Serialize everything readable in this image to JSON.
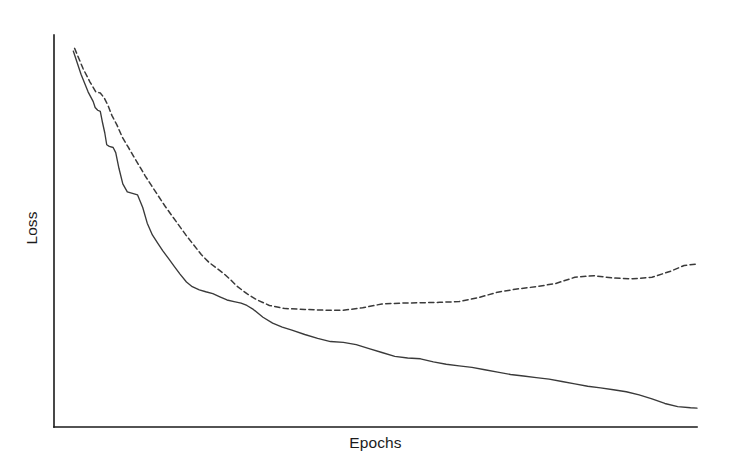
{
  "figure": {
    "width": 729,
    "height": 472,
    "background": "#ffffff",
    "title": ""
  },
  "axes": {
    "x_label": "Epochs",
    "y_label": "Loss",
    "line_color": "#1a1a1a",
    "origin_px": [
      54,
      427
    ],
    "x_end_px": [
      697,
      427
    ],
    "y_top_px": [
      54,
      35
    ]
  },
  "chart_data": {
    "type": "line",
    "title": "",
    "xlabel": "Epochs",
    "ylabel": "Loss",
    "grid": false,
    "legend": "none",
    "xlim": [
      0,
      100
    ],
    "ylim": [
      0,
      100
    ],
    "x_tick_labels": [],
    "y_tick_labels": [],
    "note": "Training loss (solid) decreases monotonically; validation loss (dashed) decreases then rises after its minimum, indicating overfitting. Axes are unlabelled (no numeric ticks). Values below are normalized: x = percent of epoch axis span, y = percent of loss axis height where 100 = top of axis.",
    "series": [
      {
        "name": "Training loss",
        "style": "solid",
        "color": "#3a3a3a",
        "dash": null,
        "x": [
          3.0,
          4.2,
          5.3,
          6.1,
          6.4,
          6.8,
          7.2,
          7.5,
          7.9,
          8.2,
          8.6,
          9.2,
          9.6,
          10.1,
          10.7,
          11.4,
          12.2,
          13.0,
          13.8,
          14.5,
          15.3,
          16.1,
          16.9,
          17.8,
          18.7,
          19.6,
          20.6,
          21.5,
          22.6,
          23.6,
          24.7,
          25.8,
          26.9,
          28.0,
          29.1,
          30.0,
          31.0,
          32.5,
          34.0,
          35.5,
          37.0,
          39.0,
          41.0,
          43.0,
          45.0,
          47.0,
          49.0,
          51.0,
          53.0,
          55.0,
          57.0,
          59.0,
          61.0,
          63.0,
          65.0,
          67.0,
          69.0,
          71.0,
          73.0,
          75.0,
          77.0,
          79.0,
          81.0,
          83.0,
          85.0,
          87.0,
          89.0,
          91.0,
          93.0,
          95.0,
          97.0,
          99.0,
          100.0
        ],
        "y": [
          95.9,
          90.0,
          85.5,
          83.0,
          81.5,
          80.8,
          80.5,
          78.0,
          75.0,
          72.0,
          71.6,
          71.3,
          70.0,
          66.0,
          62.0,
          60.0,
          59.6,
          59.2,
          56.0,
          52.0,
          49.0,
          47.0,
          45.0,
          43.0,
          41.0,
          39.0,
          37.0,
          35.8,
          35.0,
          34.5,
          34.0,
          33.2,
          32.4,
          32.0,
          31.6,
          31.0,
          30.0,
          28.0,
          26.5,
          25.5,
          24.7,
          23.6,
          22.6,
          21.8,
          21.6,
          21.0,
          20.0,
          19.0,
          18.0,
          17.6,
          17.4,
          16.6,
          16.0,
          15.6,
          15.2,
          14.6,
          14.0,
          13.4,
          13.0,
          12.6,
          12.2,
          11.6,
          11.0,
          10.4,
          10.0,
          9.5,
          9.0,
          8.2,
          7.2,
          6.0,
          5.2,
          4.9,
          4.8
        ]
      },
      {
        "name": "Validation loss",
        "style": "dashed",
        "color": "#3a3a3a",
        "dash": "5.2 3.4",
        "x": [
          3.2,
          4.5,
          5.6,
          6.5,
          7.2,
          7.8,
          8.4,
          9.0,
          9.8,
          10.6,
          11.5,
          12.4,
          13.3,
          14.2,
          15.2,
          16.2,
          17.2,
          18.3,
          19.4,
          20.5,
          21.7,
          22.9,
          24.1,
          25.3,
          26.5,
          27.5,
          28.4,
          29.2,
          30.0,
          31.5,
          33.5,
          36.0,
          39.0,
          42.0,
          45.0,
          48.0,
          51.0,
          54.0,
          57.0,
          60.0,
          63.0,
          66.0,
          69.0,
          72.0,
          75.0,
          78.0,
          81.0,
          84.0,
          87.0,
          90.0,
          93.0,
          96.0,
          98.0,
          100.0
        ],
        "y": [
          96.6,
          91.5,
          88.0,
          85.5,
          85.2,
          84.0,
          82.0,
          79.5,
          77.0,
          74.0,
          71.5,
          69.0,
          66.5,
          64.0,
          61.5,
          59.0,
          56.5,
          54.0,
          51.5,
          49.0,
          46.5,
          44.0,
          42.0,
          40.5,
          39.0,
          37.5,
          36.0,
          35.0,
          34.0,
          32.5,
          31.0,
          30.2,
          30.0,
          29.8,
          29.8,
          30.4,
          31.4,
          31.6,
          31.7,
          31.8,
          32.0,
          33.0,
          34.4,
          35.2,
          35.8,
          36.6,
          38.2,
          38.6,
          38.0,
          37.8,
          38.2,
          39.8,
          41.2,
          41.6
        ]
      }
    ]
  }
}
